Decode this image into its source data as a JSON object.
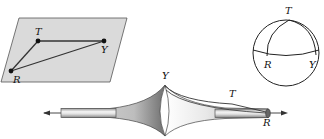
{
  "figures": {
    "plane": {
      "description": "Euclidean plane with triangle",
      "points": {
        "T": {
          "label": "T",
          "x": 38,
          "y": 41
        },
        "Y": {
          "label": "Y",
          "x": 104,
          "y": 41
        },
        "R": {
          "label": "R",
          "x": 11,
          "y": 71
        }
      },
      "fill": "#d9d9d9"
    },
    "sphere": {
      "description": "Sphere with spherical triangle",
      "labels": {
        "T": "T",
        "R": "R",
        "Y": "Y"
      }
    },
    "pseudosphere": {
      "description": "Pseudosphere with hyperbolic triangle",
      "labels": {
        "Y": "Y",
        "T": "T",
        "R": "R"
      }
    }
  },
  "colors": {
    "stroke": "#222222",
    "plane_fill": "#d9d9d9",
    "background": "#ffffff"
  }
}
